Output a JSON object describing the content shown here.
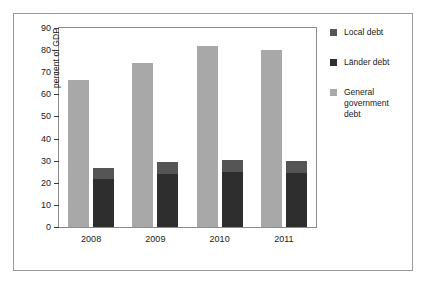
{
  "chart_data": {
    "type": "bar",
    "title": "",
    "xlabel": "",
    "ylabel": "percent of GDP",
    "categories": [
      "2008",
      "2009",
      "2010",
      "2011"
    ],
    "ylim": [
      0,
      90
    ],
    "yticks": [
      0,
      10,
      20,
      30,
      40,
      50,
      60,
      70,
      80,
      90
    ],
    "grid": false,
    "legend_position": "right",
    "stacked_group": [
      "Länder debt",
      "Local debt"
    ],
    "series": [
      {
        "name": "General government debt",
        "color": "#a8a8a8",
        "values": [
          66.5,
          74.0,
          82.0,
          80.0
        ]
      },
      {
        "name": "Länder debt",
        "color": "#2e2e2e",
        "values": [
          21.5,
          24.0,
          25.0,
          24.5
        ]
      },
      {
        "name": "Local debt",
        "color": "#555555",
        "values": [
          5.0,
          5.5,
          5.3,
          5.2
        ]
      }
    ],
    "stacked_totals": [
      26.5,
      29.5,
      30.3,
      29.7
    ]
  },
  "axis": {
    "y_tick_labels": [
      "0",
      "10",
      "20",
      "30",
      "40",
      "50",
      "60",
      "70",
      "80",
      "90"
    ],
    "y_label": "percent of GDP",
    "x_tick_labels": [
      "2008",
      "2009",
      "2010",
      "2011"
    ]
  },
  "legend": {
    "items": [
      {
        "label": "Local debt",
        "color": "#555555"
      },
      {
        "label": "Länder debt",
        "color": "#2e2e2e"
      },
      {
        "label": "General\ngovernment\ndebt",
        "color": "#a8a8a8"
      }
    ]
  },
  "colors": {
    "general": "#a8a8a8",
    "laender": "#2e2e2e",
    "local": "#555555",
    "axis": "#8c8c8c",
    "frame": "#9a9a9a",
    "text": "#1a1a1a",
    "background": "#ffffff"
  }
}
